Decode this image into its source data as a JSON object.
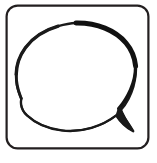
{
  "canvas": {
    "width": 157,
    "height": 163,
    "background_color": "#ffffff",
    "title": "Speech Bubble Icon"
  },
  "frame": {
    "name": "rounded-square-frame",
    "shape": "rounded-rectangle",
    "stroke_color": "#231f20",
    "stroke_width": 2.2,
    "corner_radius": 11,
    "fill": "#ffffff",
    "x": 6,
    "y": 5,
    "width": 143,
    "height": 144
  },
  "bubble": {
    "name": "speech-bubble",
    "label": "Speech bubble",
    "stroke_color": "#1a1a1a",
    "fill": "#ffffff",
    "style": "hand-drawn-variable-width",
    "stroke_width_top": 5.0,
    "stroke_width_left": 3.0,
    "stroke_width_bottom": 1.8,
    "stroke_width_right": 3.2,
    "bounds": {
      "left": 16,
      "top": 23,
      "right": 136,
      "bottom": 133
    },
    "tail": {
      "name": "speech-bubble-tail",
      "direction": "bottom-right",
      "notch_x": 119,
      "notch_y": 111,
      "tip_x": 133,
      "tip_y": 131
    }
  },
  "accessibility": {
    "alt_text": "Black outlined speech bubble inside a rounded square frame"
  }
}
